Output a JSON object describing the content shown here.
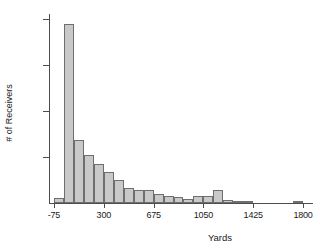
{
  "chart_data": {
    "type": "bar",
    "title": "",
    "subtitle": "",
    "xlabel": "Yards",
    "ylabel": "# of Receivers",
    "xlim": [
      -112.5,
      1875
    ],
    "ylim": [
      0,
      205
    ],
    "grid": false,
    "legend": null,
    "bin_width": 75,
    "x_ticks": [
      -75,
      300,
      675,
      1050,
      1425,
      1800
    ],
    "x_tick_labels": [
      "-75",
      "300",
      "675",
      "1050",
      "1425",
      "1800"
    ],
    "y_ticks": [
      50,
      100,
      150,
      200
    ],
    "y_tick_labels": [
      "50",
      "100",
      "150",
      "200"
    ],
    "bar_fill_color": "#c9c9c9",
    "bar_edge_color": "#6e6e6e",
    "axis_color": "#4d4d4d",
    "categories": [
      "-112.5",
      "-37.5",
      "37.5",
      "112.5",
      "187.5",
      "262.5",
      "337.5",
      "412.5",
      "487.5",
      "562.5",
      "637.5",
      "712.5",
      "787.5",
      "862.5",
      "937.5",
      "1012.5",
      "1087.5",
      "1162.5",
      "1237.5",
      "1312.5",
      "1387.5",
      "1462.5",
      "1537.5",
      "1612.5",
      "1687.5",
      "1762.5"
    ],
    "bin_starts": [
      -150,
      -75,
      0,
      75,
      150,
      225,
      300,
      375,
      450,
      525,
      600,
      675,
      750,
      825,
      900,
      975,
      1050,
      1125,
      1200,
      1275,
      1350,
      1425,
      1500,
      1575,
      1650,
      1725
    ],
    "values": [
      0,
      5,
      194,
      68,
      52,
      42,
      34,
      25,
      16,
      14,
      14,
      10,
      8,
      7,
      4,
      8,
      8,
      14,
      3,
      1,
      1,
      0,
      0,
      0,
      0,
      1
    ]
  }
}
